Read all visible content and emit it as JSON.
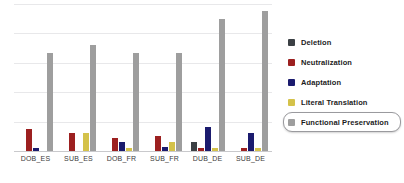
{
  "chart_data": {
    "type": "bar",
    "title": "",
    "xlabel": "",
    "ylabel": "",
    "ylim": [
      0,
      100
    ],
    "grid": true,
    "legend_position": "right",
    "categories": [
      "DOB_ES",
      "SUB_ES",
      "DOB_FR",
      "SUB_FR",
      "DUB_DE",
      "SUB_DE"
    ],
    "series": [
      {
        "name": "Deletion",
        "color": "#3b4044",
        "values": [
          0,
          0,
          0,
          0,
          6,
          0
        ]
      },
      {
        "name": "Neutralization",
        "color": "#9c2020",
        "values": [
          15,
          12,
          9,
          10,
          2,
          2
        ]
      },
      {
        "name": "Adaptation",
        "color": "#1b1b6e",
        "values": [
          2,
          0,
          6,
          3,
          16,
          12
        ]
      },
      {
        "name": "Literal Translation",
        "color": "#d4c24a",
        "values": [
          0,
          12,
          2,
          6,
          2,
          2
        ]
      },
      {
        "name": "Functional Preservation",
        "color": "#9e9e9e",
        "values": [
          67,
          72,
          67,
          67,
          90,
          95
        ]
      }
    ],
    "gridlines": [
      100,
      80,
      60,
      40,
      20
    ]
  },
  "legend": {
    "items": [
      {
        "label": "Deletion",
        "color": "#3b4044",
        "highlighted": false
      },
      {
        "label": "Neutralization",
        "color": "#9c2020",
        "highlighted": false
      },
      {
        "label": "Adaptation",
        "color": "#1b1b6e",
        "highlighted": false
      },
      {
        "label": "Literal Translation",
        "color": "#d4c24a",
        "highlighted": false
      },
      {
        "label": "Functional Preservation",
        "color": "#9e9e9e",
        "highlighted": true
      }
    ]
  }
}
